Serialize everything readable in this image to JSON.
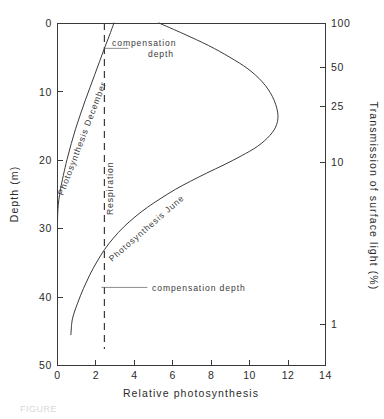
{
  "figure": {
    "caption": "FIGURE"
  },
  "chart_data": {
    "type": "line",
    "title": "",
    "xlabel": "Relative photosynthesis",
    "ylabel": "Depth (m)",
    "y2label": "Transmission of surface light (%)",
    "xlim": [
      0,
      14
    ],
    "ylim": [
      0,
      50
    ],
    "y_inverted": true,
    "grid": false,
    "legend_position": "inline-curve-labels",
    "xticks": [
      0,
      2,
      4,
      6,
      8,
      10,
      12,
      14
    ],
    "xtick_labels": [
      "0",
      "2",
      "4",
      "6",
      "8",
      "10",
      "12",
      "14"
    ],
    "yticks": [
      0,
      10,
      20,
      30,
      40,
      50
    ],
    "ytick_labels": [
      "0",
      "10",
      "20",
      "30",
      "40",
      "50"
    ],
    "y2_scale": "log",
    "y2_ticks_depth_m": [
      0,
      6.5,
      12.2,
      20.4,
      44.0
    ],
    "y2_tick_labels": [
      "100",
      "50",
      "25",
      "10",
      "1"
    ],
    "series": [
      {
        "name": "Photosynthesis December",
        "label": "Photosynthesis December",
        "style": "solid",
        "x": [
          2.95,
          2.7,
          2.45,
          2.2,
          1.95,
          1.7,
          1.45,
          1.2,
          0.95,
          0.72,
          0.5,
          0.3,
          0.16,
          0.07,
          0.02,
          0.0
        ],
        "depth_m": [
          0.0,
          1.9,
          3.7,
          5.6,
          7.5,
          9.4,
          11.3,
          13.3,
          15.4,
          17.6,
          19.9,
          22.3,
          24.2,
          25.8,
          27.3,
          29.0
        ]
      },
      {
        "name": "Photosynthesis June",
        "label": "Photosynthesis June",
        "style": "solid",
        "x": [
          5.3,
          6.6,
          7.9,
          9.0,
          9.95,
          10.7,
          11.22,
          11.5,
          11.45,
          11.1,
          10.45,
          9.6,
          8.7,
          7.8,
          6.95,
          6.15,
          5.4,
          4.7,
          4.05,
          3.45,
          2.92,
          2.45,
          2.05,
          1.68,
          1.35,
          1.05,
          0.78,
          0.7
        ],
        "depth_m": [
          0.0,
          1.6,
          3.3,
          5.0,
          6.7,
          8.6,
          10.7,
          13.0,
          14.8,
          16.4,
          18.0,
          19.4,
          20.7,
          21.9,
          23.1,
          24.3,
          25.6,
          26.9,
          28.3,
          29.8,
          31.4,
          33.1,
          34.9,
          36.8,
          38.8,
          40.9,
          43.2,
          45.5
        ]
      }
    ],
    "reference_lines": [
      {
        "name": "Respiration",
        "label": "Respiration",
        "orientation": "vertical",
        "x": 2.45,
        "style": "dashed"
      }
    ],
    "annotations": [
      {
        "name": "compensation-depth-upper",
        "text_line1": "compensation",
        "text_line2": "depth",
        "text": "compensation depth",
        "x": 2.45,
        "depth_m": 3.7
      },
      {
        "name": "compensation-depth-lower",
        "text_line1": "compensation depth",
        "text_line2": "",
        "text": "compensation depth",
        "x": 2.45,
        "depth_m": 38.6
      }
    ]
  },
  "axes": {
    "left": {
      "title": "Depth (m)",
      "labels": [
        "0",
        "10",
        "20",
        "30",
        "40",
        "50"
      ]
    },
    "right": {
      "title": "Transmission of surface light (%)",
      "labels": [
        "100",
        "50",
        "25",
        "10",
        "1"
      ]
    },
    "bottom": {
      "title": "Relative photosynthesis",
      "labels": [
        "0",
        "2",
        "4",
        "6",
        "8",
        "10",
        "12",
        "14"
      ]
    }
  },
  "labels": {
    "curve_december": "Photosynthesis December",
    "curve_june": "Photosynthesis June",
    "respiration": "Respiration",
    "compensation_upper_line1": "compensation",
    "compensation_upper_line2": "depth",
    "compensation_lower": "compensation depth"
  }
}
